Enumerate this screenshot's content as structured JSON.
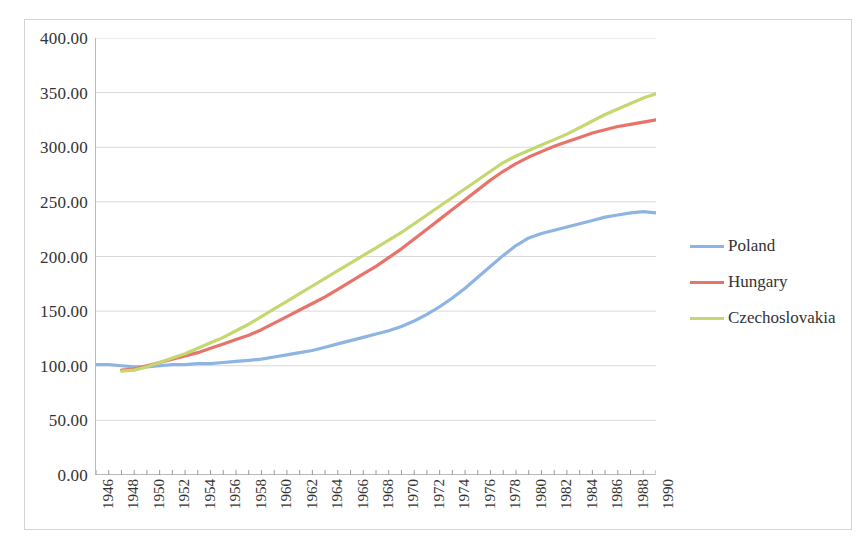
{
  "chart_data": {
    "type": "line",
    "title": "",
    "xlabel": "",
    "ylabel": "",
    "xlim": [
      1946,
      1990
    ],
    "ylim": [
      0,
      400
    ],
    "ytick_step": 50,
    "grid": true,
    "grid_axis": "y",
    "legend_position": "right",
    "x": [
      1946,
      1947,
      1948,
      1949,
      1950,
      1951,
      1952,
      1953,
      1954,
      1955,
      1956,
      1957,
      1958,
      1959,
      1960,
      1961,
      1962,
      1963,
      1964,
      1965,
      1966,
      1967,
      1968,
      1969,
      1970,
      1971,
      1972,
      1973,
      1974,
      1975,
      1976,
      1977,
      1978,
      1979,
      1980,
      1981,
      1982,
      1983,
      1984,
      1985,
      1986,
      1987,
      1988,
      1989,
      1990
    ],
    "yticks": [
      "0.00",
      "50.00",
      "100.00",
      "150.00",
      "200.00",
      "250.00",
      "300.00",
      "350.00",
      "400.00"
    ],
    "xticks": [
      "1946",
      "1948",
      "1950",
      "1952",
      "1954",
      "1956",
      "1958",
      "1960",
      "1962",
      "1964",
      "1966",
      "1968",
      "1970",
      "1972",
      "1974",
      "1976",
      "1978",
      "1980",
      "1982",
      "1984",
      "1986",
      "1988",
      "1990"
    ],
    "series": [
      {
        "name": "Poland",
        "color": "#8EB4E3",
        "values": [
          101,
          101,
          100,
          99,
          99,
          100,
          101,
          101,
          102,
          102,
          103,
          104,
          105,
          106,
          108,
          110,
          112,
          114,
          117,
          120,
          123,
          126,
          129,
          132,
          136,
          141,
          147,
          154,
          162,
          171,
          181,
          191,
          201,
          210,
          217,
          221,
          224,
          227,
          230,
          233,
          236,
          238,
          240,
          241,
          240
        ]
      },
      {
        "name": "Hungary",
        "color": "#E8736A",
        "values": [
          null,
          null,
          96,
          97,
          100,
          103,
          106,
          109,
          112,
          116,
          120,
          124,
          128,
          133,
          139,
          145,
          151,
          157,
          163,
          170,
          177,
          184,
          191,
          199,
          207,
          216,
          225,
          234,
          243,
          252,
          261,
          270,
          278,
          285,
          291,
          296,
          301,
          305,
          309,
          313,
          316,
          319,
          321,
          323,
          325
        ]
      },
      {
        "name": "Czechoslovakia",
        "color": "#C3D86E",
        "values": [
          null,
          null,
          95,
          96,
          99,
          103,
          107,
          111,
          116,
          121,
          126,
          132,
          138,
          145,
          152,
          159,
          166,
          173,
          180,
          187,
          194,
          201,
          208,
          215,
          222,
          230,
          238,
          246,
          254,
          262,
          270,
          278,
          286,
          292,
          297,
          302,
          307,
          312,
          318,
          324,
          330,
          335,
          340,
          345,
          349
        ]
      }
    ]
  },
  "legend": {
    "items": [
      {
        "label": "Poland",
        "color": "#8EB4E3"
      },
      {
        "label": "Hungary",
        "color": "#E8736A"
      },
      {
        "label": "Czechoslovakia",
        "color": "#C3D86E"
      }
    ]
  }
}
